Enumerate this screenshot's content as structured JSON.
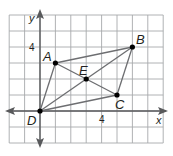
{
  "diagram": {
    "type": "coordinate-plane-parallelogram",
    "grid": {
      "x_min": -2,
      "x_max": 8,
      "y_min": -2,
      "y_max": 6,
      "line_color": "#a7a9ac",
      "bg": "#ffffff"
    },
    "axes": {
      "x_label": "x",
      "y_label": "y",
      "color": "#58595b"
    },
    "ticks": {
      "x_tick": "4",
      "y_tick": "4"
    },
    "points": [
      {
        "name": "A",
        "x": 1,
        "y": 3
      },
      {
        "name": "B",
        "x": 6,
        "y": 4
      },
      {
        "name": "C",
        "x": 5,
        "y": 1
      },
      {
        "name": "D",
        "x": 0,
        "y": 0
      },
      {
        "name": "E",
        "x": 3,
        "y": 2
      }
    ],
    "segments": [
      [
        "D",
        "A"
      ],
      [
        "A",
        "B"
      ],
      [
        "B",
        "C"
      ],
      [
        "C",
        "D"
      ],
      [
        "A",
        "C"
      ],
      [
        "D",
        "B"
      ]
    ],
    "segment_color": "#6d6e71",
    "point_color": "#000000"
  },
  "labels": {
    "A": "A",
    "B": "B",
    "C": "C",
    "D": "D",
    "E": "E",
    "x": "x",
    "y": "y",
    "tick4x": "4",
    "tick4y": "4"
  }
}
